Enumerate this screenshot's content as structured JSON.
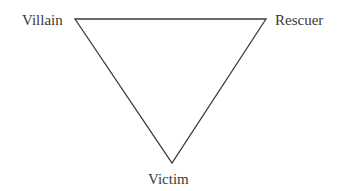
{
  "diagram": {
    "nodes": [
      {
        "id": "villain",
        "label": "Villain"
      },
      {
        "id": "rescuer",
        "label": "Rescuer"
      },
      {
        "id": "victim",
        "label": "Victim"
      }
    ],
    "edges": [
      {
        "from": "villain",
        "to": "rescuer"
      },
      {
        "from": "rescuer",
        "to": "victim"
      },
      {
        "from": "victim",
        "to": "villain"
      }
    ],
    "line_color": "#3a3a3a"
  }
}
